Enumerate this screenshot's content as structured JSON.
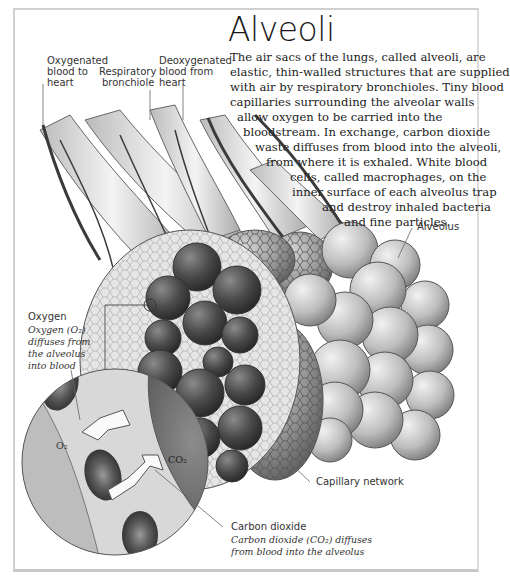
{
  "page": {
    "running_head": "",
    "title": "Alveoli"
  },
  "intro": {
    "lines": [
      "The air sacs of the lungs, called alveoli, are",
      "elastic, thin-walled structures that are supplied",
      "with air by respiratory bronchioles. Tiny blood",
      "capillaries surrounding the alveolar walls",
      "allow oxygen to be carried into the",
      "bloodstream. In exchange, carbon dioxide",
      "waste diffuses from blood into the alveoli,",
      "from where it is exhaled. White blood",
      "cells, called macrophages, on the",
      "inner surface of each alveolus trap",
      "and destroy inhaled bacteria",
      "and fine particles."
    ]
  },
  "labels": {
    "oxygenated": [
      "Oxygenated",
      "blood to",
      "heart"
    ],
    "bronchiole": [
      "Respiratory",
      "bronchiole"
    ],
    "deoxygenated": [
      "Deoxygenated",
      "blood from",
      "heart"
    ],
    "alveolus": "Alveolus",
    "capillary": "Capillary network",
    "oxygen": {
      "heading": "Oxygen",
      "desc": [
        "Oxygen (O₂)",
        "diffuses from",
        "the alveolus",
        "into blood"
      ]
    },
    "carbon_dioxide": {
      "heading": "Carbon dioxide",
      "desc": [
        "Carbon dioxide (CO₂) diffuses",
        "from blood into the alveolus"
      ]
    },
    "inset_o2": "O₂",
    "inset_co2": "CO₂"
  },
  "colors": {
    "frame": "#cfcfcf",
    "ink": "#222222",
    "dark_sac": "#3c3c3c",
    "light_sac": "#b9b9b9"
  }
}
